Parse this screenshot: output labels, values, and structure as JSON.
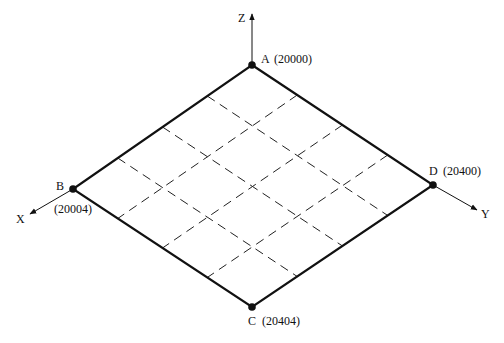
{
  "diagram": {
    "type": "isometric grid plane",
    "colors": {
      "line": "#111111",
      "background": "#ffffff"
    },
    "grid_divisions": 4,
    "vertices": [
      {
        "id": "A",
        "label": "A",
        "value": "(20000)",
        "x": 252,
        "y": 65
      },
      {
        "id": "B",
        "label": "B",
        "value": "(20004)",
        "x": 73,
        "y": 189
      },
      {
        "id": "C",
        "label": "C",
        "value": "(20404)",
        "x": 252,
        "y": 307
      },
      {
        "id": "D",
        "label": "D",
        "value": "(20400)",
        "x": 433,
        "y": 185
      }
    ],
    "axes": [
      {
        "id": "Z",
        "label": "Z",
        "from": [
          252,
          65
        ],
        "to": [
          252,
          14
        ]
      },
      {
        "id": "X",
        "label": "X",
        "from": [
          73,
          189
        ],
        "to": [
          30,
          214
        ]
      },
      {
        "id": "Y",
        "label": "Y",
        "from": [
          433,
          185
        ],
        "to": [
          477,
          210
        ]
      }
    ],
    "labels": {
      "A": "A",
      "A_value": "(20000)",
      "B": "B",
      "B_value": "(20004)",
      "C": "C",
      "C_value": "(20404)",
      "D": "D",
      "D_value": "(20400)",
      "axis_x": "X",
      "axis_y": "Y",
      "axis_z": "Z"
    }
  }
}
